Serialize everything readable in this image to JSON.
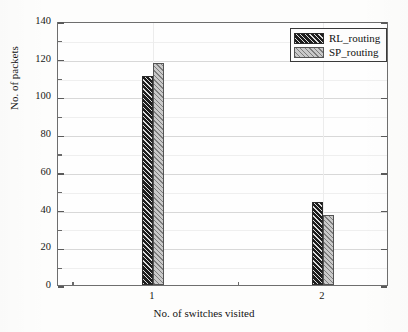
{
  "chart_data": {
    "type": "bar",
    "title": "",
    "xlabel": "No. of switches visited",
    "ylabel": "No. of packets",
    "categories": [
      "1",
      "2"
    ],
    "series": [
      {
        "name": "RL_routing",
        "values": [
          111,
          44
        ],
        "color": "#1d1d1d",
        "hatch": "diagonal-dark"
      },
      {
        "name": "SP_routing",
        "values": [
          118,
          37
        ],
        "color": "#c9c9c9",
        "hatch": "diagonal-light"
      }
    ],
    "ylim": [
      0,
      140
    ],
    "ytick_step": 20,
    "yticks": [
      "0",
      "20",
      "40",
      "60",
      "80",
      "100",
      "120",
      "140"
    ],
    "yminor_step": 10,
    "xticks": [
      "1",
      "2"
    ],
    "grid": true,
    "legend_position": "top-right"
  },
  "legend": {
    "entries": [
      {
        "label": "RL_routing"
      },
      {
        "label": "SP_routing"
      }
    ]
  },
  "axes": {
    "y_title": "No. of packets",
    "x_title": "No. of switches visited"
  }
}
